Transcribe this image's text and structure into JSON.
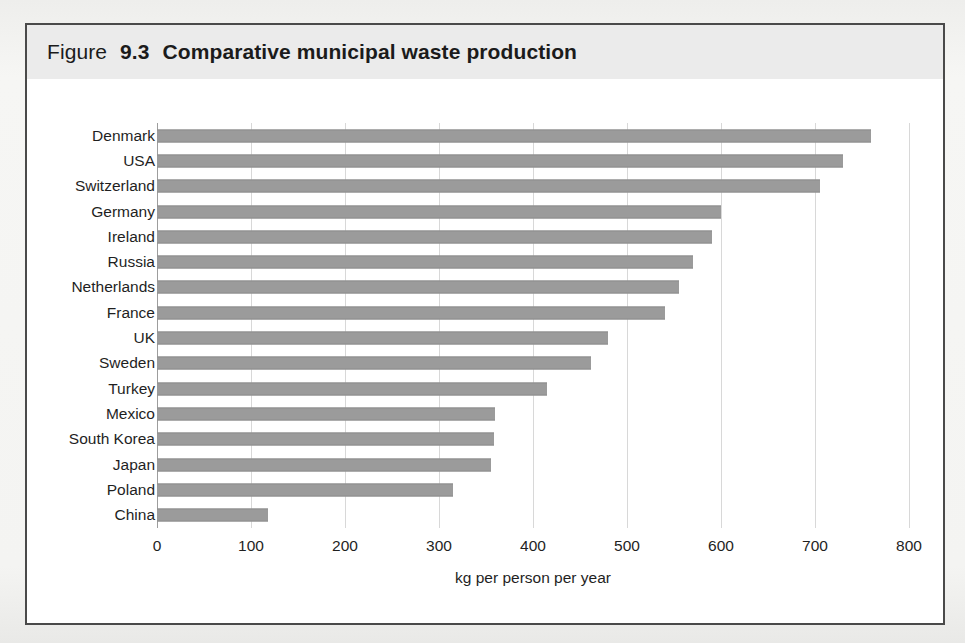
{
  "figure": {
    "label_lead": "Figure",
    "label_number": "9.3",
    "title": "Comparative municipal waste production",
    "title_full": "Figure 9.3  Comparative municipal waste production"
  },
  "colors": {
    "bar_fill": "#9b9b9b",
    "title_band": "#ebebeb",
    "frame_border": "#4a4a4a",
    "gridline": "#d8d8d8",
    "axis_line": "#9d9d9d",
    "text": "#1f1f1f",
    "page_background": "#f4f4f2",
    "plot_background": "#ffffff"
  },
  "chart_data": {
    "type": "bar",
    "orientation": "horizontal",
    "title": "Figure 9.3  Comparative municipal waste production",
    "xlabel": "kg per person per year",
    "ylabel": "",
    "categories": [
      "Denmark",
      "USA",
      "Switzerland",
      "Germany",
      "Ireland",
      "Russia",
      "Netherlands",
      "France",
      "UK",
      "Sweden",
      "Turkey",
      "Mexico",
      "South Korea",
      "Japan",
      "Poland",
      "China"
    ],
    "values": [
      760,
      730,
      705,
      600,
      590,
      570,
      555,
      540,
      480,
      462,
      415,
      360,
      358,
      355,
      315,
      118
    ],
    "units": "kg per person per year",
    "xlim": [
      0,
      800
    ],
    "xticks": [
      0,
      100,
      200,
      300,
      400,
      500,
      600,
      700,
      800
    ],
    "xtick_labels": [
      "0",
      "100",
      "200",
      "300",
      "400",
      "500",
      "600",
      "700",
      "800"
    ],
    "grid": "vertical",
    "legend": null,
    "sorted": "descending"
  }
}
